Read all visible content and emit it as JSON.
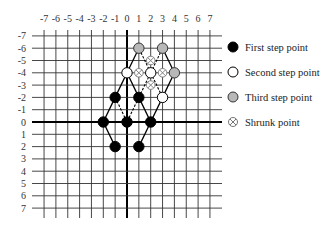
{
  "chart_data": {
    "type": "scatter",
    "title": "",
    "x_ticks": [
      "-7",
      "-6",
      "-5",
      "-4",
      "-3",
      "-2",
      "-1",
      "0",
      "1",
      "2",
      "3",
      "4",
      "5",
      "6",
      "7"
    ],
    "y_ticks": [
      "-7",
      "-6",
      "-5",
      "-4",
      "-3",
      "-2",
      "-1",
      "0",
      "1",
      "2",
      "3",
      "4",
      "5",
      "6",
      "7"
    ],
    "xlim": [
      -7,
      7
    ],
    "ylim": [
      -7,
      7
    ],
    "y_axis_inverted": true,
    "grid": true,
    "legend_position": "right",
    "series": [
      {
        "name": "First step point",
        "marker": "filled-black",
        "points": [
          [
            -1,
            -2
          ],
          [
            1,
            -2
          ],
          [
            -2,
            0
          ],
          [
            0,
            0
          ],
          [
            2,
            0
          ],
          [
            -1,
            2
          ],
          [
            1,
            2
          ]
        ]
      },
      {
        "name": "Second step point",
        "marker": "hollow-white",
        "points": [
          [
            0,
            -4
          ],
          [
            2,
            -4
          ],
          [
            3,
            -2
          ]
        ]
      },
      {
        "name": "Third step point",
        "marker": "filled-gray",
        "points": [
          [
            1,
            -6
          ],
          [
            3,
            -6
          ],
          [
            4,
            -4
          ]
        ]
      },
      {
        "name": "Shrunk point",
        "marker": "circled-x",
        "points": [
          [
            2,
            -5
          ],
          [
            1,
            -4
          ],
          [
            3,
            -4
          ],
          [
            2,
            -3
          ]
        ]
      }
    ],
    "solid_edges": [
      [
        [
          -1,
          2
        ],
        [
          -2,
          0
        ]
      ],
      [
        [
          -2,
          0
        ],
        [
          -1,
          -2
        ]
      ],
      [
        [
          -1,
          -2
        ],
        [
          0,
          -4
        ]
      ],
      [
        [
          0,
          -4
        ],
        [
          1,
          -2
        ]
      ],
      [
        [
          1,
          -2
        ],
        [
          2,
          0
        ]
      ],
      [
        [
          2,
          0
        ],
        [
          1,
          2
        ]
      ],
      [
        [
          2,
          0
        ],
        [
          3,
          -2
        ]
      ],
      [
        [
          3,
          -2
        ],
        [
          4,
          -4
        ]
      ],
      [
        [
          4,
          -4
        ],
        [
          3,
          -6
        ]
      ],
      [
        [
          0,
          -4
        ],
        [
          1,
          -6
        ]
      ]
    ],
    "dashed_edges": [
      [
        [
          -1,
          -2
        ],
        [
          0,
          0
        ]
      ],
      [
        [
          1,
          -2
        ],
        [
          0,
          0
        ]
      ],
      [
        [
          1,
          -2
        ],
        [
          2,
          -4
        ]
      ],
      [
        [
          2,
          -4
        ],
        [
          3,
          -2
        ]
      ],
      [
        [
          2,
          -4
        ],
        [
          1,
          -6
        ]
      ],
      [
        [
          2,
          -4
        ],
        [
          3,
          -6
        ]
      ]
    ]
  },
  "legend": {
    "items": [
      {
        "label": "First step point"
      },
      {
        "label": "Second step point"
      },
      {
        "label": "Third step point"
      },
      {
        "label": "Shrunk point"
      }
    ]
  },
  "colors": {
    "grid": "#333333",
    "axis": "#000000",
    "first": "#000000",
    "second": "#ffffff",
    "third": "#b8b8b8",
    "shrunk_stroke": "#777777"
  }
}
